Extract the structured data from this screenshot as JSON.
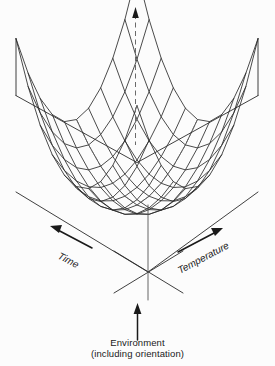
{
  "figure": {
    "kind": "3d-wireframe-surface-diagram",
    "background_color": "#fcfcfc",
    "line_color": "#2a2a2a",
    "vertical_axis": {
      "name": "vertical-response-axis",
      "style": "dashed-with-arrowhead",
      "label": ""
    },
    "axes": [
      {
        "id": "time",
        "label": "Time",
        "arrow_direction": "up-left",
        "style": "italic"
      },
      {
        "id": "temperature",
        "label": "Temperature",
        "arrow_direction": "up-right",
        "style": "italic"
      }
    ],
    "caption": {
      "line1": "Environment",
      "line2": "(including orientation)",
      "arrow_direction": "up"
    },
    "surface": {
      "type": "saddle-valley-mesh",
      "grid_u_divisions": 10,
      "grid_v_divisions": 10,
      "hidden_lines_style": "dashed"
    }
  },
  "chart_data": {
    "type": "surface",
    "title": "",
    "xlabel": "Time",
    "ylabel": "Temperature",
    "zlabel": "Environment (including orientation)",
    "x": [
      -1,
      -0.8,
      -0.6,
      -0.4,
      -0.2,
      0,
      0.2,
      0.4,
      0.6,
      0.8,
      1
    ],
    "y": [
      -1,
      -0.8,
      -0.6,
      -0.4,
      -0.2,
      0,
      0.2,
      0.4,
      0.6,
      0.8,
      1
    ],
    "z_formula": "z = (x^2) * (y^2) scaled; minimum at center, maximum at far corner",
    "z": [
      [
        1.0,
        0.64,
        0.36,
        0.16,
        0.04,
        0.0,
        0.04,
        0.16,
        0.36,
        0.64,
        1.0
      ],
      [
        0.64,
        0.41,
        0.23,
        0.1,
        0.03,
        0.0,
        0.03,
        0.1,
        0.23,
        0.41,
        0.64
      ],
      [
        0.36,
        0.23,
        0.13,
        0.06,
        0.01,
        0.0,
        0.01,
        0.06,
        0.13,
        0.23,
        0.36
      ],
      [
        0.16,
        0.1,
        0.06,
        0.03,
        0.01,
        0.0,
        0.01,
        0.03,
        0.06,
        0.1,
        0.16
      ],
      [
        0.04,
        0.03,
        0.01,
        0.01,
        0.0,
        0.0,
        0.0,
        0.01,
        0.01,
        0.03,
        0.04
      ],
      [
        0.0,
        0.0,
        0.0,
        0.0,
        0.0,
        0.0,
        0.0,
        0.0,
        0.0,
        0.0,
        0.0
      ],
      [
        0.04,
        0.03,
        0.01,
        0.01,
        0.0,
        0.0,
        0.0,
        0.01,
        0.01,
        0.03,
        0.04
      ],
      [
        0.16,
        0.1,
        0.06,
        0.03,
        0.01,
        0.0,
        0.01,
        0.03,
        0.06,
        0.1,
        0.16
      ],
      [
        0.36,
        0.23,
        0.13,
        0.06,
        0.01,
        0.0,
        0.01,
        0.06,
        0.13,
        0.23,
        0.36
      ],
      [
        0.64,
        0.41,
        0.23,
        0.1,
        0.03,
        0.0,
        0.03,
        0.1,
        0.23,
        0.41,
        0.64
      ],
      [
        1.0,
        0.64,
        0.36,
        0.16,
        0.04,
        0.0,
        0.04,
        0.16,
        0.36,
        0.64,
        1.0
      ]
    ],
    "xlim": [
      -1,
      1
    ],
    "ylim": [
      -1,
      1
    ],
    "zlim": [
      0,
      1
    ],
    "grid": true,
    "legend": false
  }
}
